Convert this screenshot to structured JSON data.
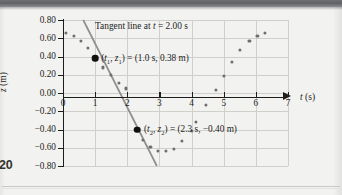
{
  "page": {
    "page_number": "20"
  },
  "figure": {
    "caption": "Tangent line at t = 2.00 s",
    "caption_parts": {
      "prefix": "Tangent line at ",
      "variable": "t",
      "suffix": " = 2.00 s"
    },
    "annotations": [
      {
        "id": "point-1",
        "text": "(t1, z1) = (1.0 s, 0.38 m)",
        "t": 1.0,
        "z": 0.38
      },
      {
        "id": "point-2",
        "text": "(t2, z2) = (2.3 s, −0.40 m)",
        "t": 2.3,
        "z": -0.4
      }
    ]
  },
  "chart_data": {
    "type": "scatter",
    "title": "",
    "xlabel": "t (s)",
    "ylabel": "z (m)",
    "xlim": [
      0,
      7
    ],
    "ylim": [
      -0.8,
      0.8
    ],
    "xticks": [
      0,
      1,
      2,
      3,
      4,
      5,
      6,
      7
    ],
    "xtick_labels": [
      "0",
      "1",
      "2",
      "3",
      "4",
      "5",
      "6",
      "7"
    ],
    "yticks": [
      0.8,
      0.6,
      0.4,
      0.2,
      0.0,
      -0.2,
      -0.4,
      -0.6,
      -0.8
    ],
    "ytick_labels": [
      "0.80",
      "0.60",
      "0.40",
      "0.20",
      "0.00",
      "−0.20",
      "−0.40",
      "−0.60",
      "−0.80"
    ],
    "grid": true,
    "legend": "none",
    "series": [
      {
        "name": "z(t) data",
        "marker": "circle",
        "color": "#6e6e6e",
        "points": [
          [
            0.1,
            0.66
          ],
          [
            0.35,
            0.63
          ],
          [
            0.55,
            0.57
          ],
          [
            0.78,
            0.49
          ],
          [
            1.0,
            0.38
          ],
          [
            1.25,
            0.28
          ],
          [
            1.5,
            0.2
          ],
          [
            1.75,
            0.11
          ],
          [
            1.95,
            0.05
          ],
          [
            2.3,
            -0.4
          ],
          [
            2.5,
            -0.51
          ],
          [
            2.72,
            -0.59
          ],
          [
            2.95,
            -0.64
          ],
          [
            3.2,
            -0.64
          ],
          [
            3.45,
            -0.61
          ],
          [
            3.7,
            -0.53
          ],
          [
            4.0,
            -0.42
          ],
          [
            4.15,
            -0.32
          ],
          [
            4.45,
            -0.13
          ],
          [
            4.75,
            0.03
          ],
          [
            5.0,
            0.19
          ],
          [
            5.25,
            0.34
          ],
          [
            5.5,
            0.47
          ],
          [
            5.8,
            0.57
          ],
          [
            6.05,
            0.63
          ],
          [
            6.28,
            0.66
          ]
        ]
      }
    ],
    "highlighted_points": [
      {
        "label": "(t1, z1)",
        "t": 1.0,
        "z": 0.38,
        "color": "#111111"
      },
      {
        "label": "(t2, z2)",
        "t": 2.3,
        "z": -0.4,
        "color": "#111111"
      }
    ],
    "tangent_line": {
      "label": "Tangent line at t = 2.00 s",
      "at_t": 2.0,
      "through": [
        [
          1.0,
          0.38
        ],
        [
          2.3,
          -0.4
        ]
      ],
      "slope": -0.6,
      "color": "#8f8f8f",
      "draw_from": [
        0.63,
        0.8
      ],
      "draw_to": [
        2.92,
        -0.8
      ]
    }
  }
}
